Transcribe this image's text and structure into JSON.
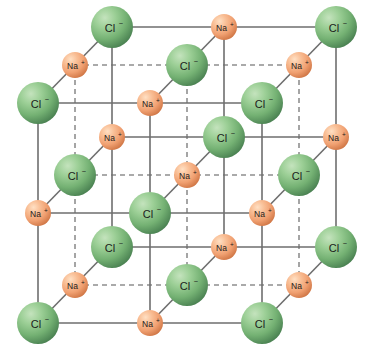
{
  "figure": {
    "name": "sodium-chloride-crystal-lattice",
    "background_color": "#ffffff",
    "width": 370,
    "height": 357
  },
  "species": {
    "chloride": {
      "label": "Cl",
      "charge": "−",
      "full_label": "Cl⁻",
      "color_light": "#a8d4a2",
      "color_mid": "#74b173",
      "color_dark": "#4e8a54",
      "radius": 21,
      "count": 14
    },
    "sodium": {
      "label": "Na",
      "charge": "+",
      "full_label": "Na⁺",
      "color_light": "#fbc9a0",
      "color_mid": "#f0a071",
      "color_dark": "#d9804c",
      "radius": 13,
      "count": 13
    }
  },
  "bonds": {
    "color": "#6e6e6e",
    "width": 1.6,
    "hidden_color": "#8f8f8f",
    "hidden_dash": "5,4"
  },
  "geometry": {
    "origin_x": 38,
    "origin_y": 323,
    "step_x": 112,
    "step_y": -110,
    "depth_x": 37,
    "depth_y": -38,
    "grid_n": 3
  },
  "ions": [
    {
      "i": 0,
      "j": 0,
      "k": 0,
      "type": "chloride",
      "x": 38,
      "y": 323,
      "label": "Cl⁻"
    },
    {
      "i": 1,
      "j": 0,
      "k": 0,
      "type": "sodium",
      "x": 150,
      "y": 323,
      "label": "Na⁺"
    },
    {
      "i": 2,
      "j": 0,
      "k": 0,
      "type": "chloride",
      "x": 262,
      "y": 323,
      "label": "Cl⁻"
    },
    {
      "i": 0,
      "j": 1,
      "k": 0,
      "type": "sodium",
      "x": 38,
      "y": 213,
      "label": "Na⁺"
    },
    {
      "i": 1,
      "j": 1,
      "k": 0,
      "type": "chloride",
      "x": 150,
      "y": 213,
      "label": "Cl⁻"
    },
    {
      "i": 2,
      "j": 1,
      "k": 0,
      "type": "sodium",
      "x": 262,
      "y": 213,
      "label": "Na⁺"
    },
    {
      "i": 0,
      "j": 2,
      "k": 0,
      "type": "chloride",
      "x": 38,
      "y": 103,
      "label": "Cl⁻"
    },
    {
      "i": 1,
      "j": 2,
      "k": 0,
      "type": "sodium",
      "x": 150,
      "y": 103,
      "label": "Na⁺"
    },
    {
      "i": 2,
      "j": 2,
      "k": 0,
      "type": "chloride",
      "x": 262,
      "y": 103,
      "label": "Cl⁻"
    },
    {
      "i": 0,
      "j": 0,
      "k": 1,
      "type": "sodium",
      "x": 75,
      "y": 285,
      "label": "Na⁺"
    },
    {
      "i": 1,
      "j": 0,
      "k": 1,
      "type": "chloride",
      "x": 187,
      "y": 285,
      "label": "Cl⁻"
    },
    {
      "i": 2,
      "j": 0,
      "k": 1,
      "type": "sodium",
      "x": 299,
      "y": 285,
      "label": "Na⁺"
    },
    {
      "i": 0,
      "j": 1,
      "k": 1,
      "type": "chloride",
      "x": 75,
      "y": 175,
      "label": "Cl⁻"
    },
    {
      "i": 1,
      "j": 1,
      "k": 1,
      "type": "sodium",
      "x": 187,
      "y": 175,
      "label": "Na⁺"
    },
    {
      "i": 2,
      "j": 1,
      "k": 1,
      "type": "chloride",
      "x": 299,
      "y": 175,
      "label": "Cl⁻"
    },
    {
      "i": 0,
      "j": 2,
      "k": 1,
      "type": "sodium",
      "x": 75,
      "y": 65,
      "label": "Na⁺"
    },
    {
      "i": 1,
      "j": 2,
      "k": 1,
      "type": "chloride",
      "x": 187,
      "y": 65,
      "label": "Cl⁻"
    },
    {
      "i": 2,
      "j": 2,
      "k": 1,
      "type": "sodium",
      "x": 299,
      "y": 65,
      "label": "Na⁺"
    },
    {
      "i": 0,
      "j": 0,
      "k": 2,
      "type": "chloride",
      "x": 112,
      "y": 247,
      "label": "Cl⁻"
    },
    {
      "i": 1,
      "j": 0,
      "k": 2,
      "type": "sodium",
      "x": 224,
      "y": 247,
      "label": "Na⁺"
    },
    {
      "i": 2,
      "j": 0,
      "k": 2,
      "type": "chloride",
      "x": 336,
      "y": 247,
      "label": "Cl⁻"
    },
    {
      "i": 0,
      "j": 1,
      "k": 2,
      "type": "sodium",
      "x": 112,
      "y": 137,
      "label": "Na⁺"
    },
    {
      "i": 1,
      "j": 1,
      "k": 2,
      "type": "chloride",
      "x": 224,
      "y": 137,
      "label": "Cl⁻"
    },
    {
      "i": 2,
      "j": 1,
      "k": 2,
      "type": "sodium",
      "x": 336,
      "y": 137,
      "label": "Na⁺"
    },
    {
      "i": 0,
      "j": 2,
      "k": 2,
      "type": "chloride",
      "x": 112,
      "y": 27,
      "label": "Cl⁻"
    },
    {
      "i": 1,
      "j": 2,
      "k": 2,
      "type": "sodium",
      "x": 224,
      "y": 27,
      "label": "Na⁺"
    },
    {
      "i": 2,
      "j": 2,
      "k": 2,
      "type": "chloride",
      "x": 336,
      "y": 27,
      "label": "Cl⁻"
    }
  ]
}
